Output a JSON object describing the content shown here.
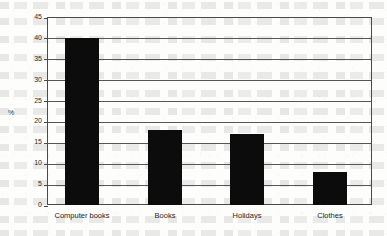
{
  "chart_data": {
    "type": "bar",
    "title": "",
    "subtitle": "",
    "xlabel": "",
    "ylabel": "%",
    "categories": [
      "Computer books",
      "Books",
      "Holidays",
      "Clothes"
    ],
    "values": [
      40,
      18,
      17,
      8
    ],
    "series": [
      {
        "name": "Percentage",
        "values": [
          40,
          18,
          17,
          8
        ]
      }
    ],
    "ylim": [
      0,
      45
    ],
    "ytick_labels": [
      "45",
      "40",
      "35",
      "30",
      "25",
      "20",
      "15",
      "10",
      "5",
      "0"
    ],
    "ytick_values": [
      45,
      40,
      35,
      30,
      25,
      20,
      15,
      10,
      5,
      0
    ],
    "ytick_step": 5,
    "grid": "horizontal",
    "legend": "none",
    "bar_color": "#0c0c0c",
    "axis_color": "#4a4a4a",
    "gridline_color": "#55555a",
    "background_color": "#fdfdfc",
    "annotations": []
  }
}
